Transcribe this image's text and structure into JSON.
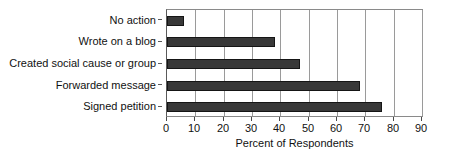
{
  "chart_data": {
    "type": "bar",
    "orientation": "horizontal",
    "title": "",
    "xlabel": "Percent of Respondents",
    "ylabel": "",
    "categories": [
      "No action",
      "Wrote on a blog",
      "Created social cause or group",
      "Forwarded message",
      "Signed petition"
    ],
    "values": [
      6,
      38,
      47,
      68,
      76
    ],
    "xlim": [
      0,
      90
    ],
    "xticks": [
      0,
      10,
      20,
      30,
      40,
      50,
      60,
      70,
      80,
      90
    ],
    "xtick_labels": [
      "0",
      "10",
      "20",
      "30",
      "40",
      "50",
      "60",
      "70",
      "80",
      "90"
    ],
    "grid": "vertical",
    "legend": "none",
    "bar_color": "#383838",
    "bar_edge_color": "#151515",
    "axis_color": "#8a8a8a",
    "background": "#ffffff",
    "category_order": "top-to-bottom"
  }
}
